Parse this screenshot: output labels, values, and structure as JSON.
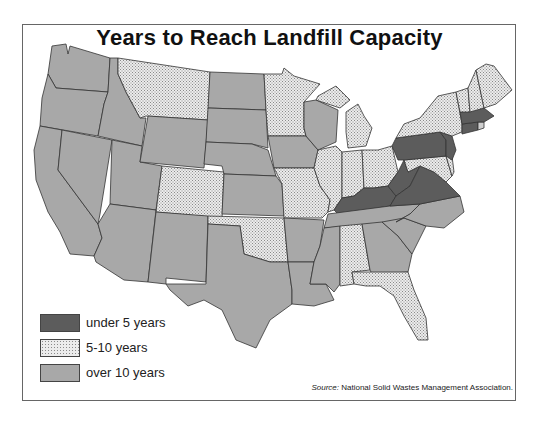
{
  "title": "Years to Reach Landfill Capacity",
  "legend": [
    {
      "label": "under 5 years",
      "category": "under5",
      "color": "#5c5c5c",
      "pattern": "solid-dark"
    },
    {
      "label": "5-10 years",
      "category": "5to10",
      "color": "#e6e6e6",
      "pattern": "dotted"
    },
    {
      "label": "over 10 years",
      "category": "over10",
      "color": "#a8a8a8",
      "pattern": "solid-gray"
    }
  ],
  "source": {
    "prefix": "Source:",
    "text": "National Solid Wastes Management Association."
  },
  "states": {
    "under5": [
      "Pennsylvania",
      "New Jersey",
      "Massachusetts",
      "Connecticut",
      "Kentucky",
      "West Virginia",
      "Virginia"
    ],
    "5to10": [
      "Montana",
      "Colorado",
      "Minnesota",
      "Missouri",
      "Oklahoma",
      "Illinois",
      "Michigan",
      "Indiana",
      "Ohio",
      "New York",
      "Vermont",
      "New Hampshire",
      "Maine",
      "Maryland",
      "Delaware",
      "Alabama",
      "Florida"
    ],
    "over10": [
      "Washington",
      "Oregon",
      "California",
      "Idaho",
      "Nevada",
      "Utah",
      "Arizona",
      "Wyoming",
      "New Mexico",
      "North Dakota",
      "South Dakota",
      "Nebraska",
      "Kansas",
      "Texas",
      "Iowa",
      "Wisconsin",
      "Arkansas",
      "Louisiana",
      "Mississippi",
      "Tennessee",
      "Georgia",
      "South Carolina",
      "North Carolina"
    ]
  }
}
